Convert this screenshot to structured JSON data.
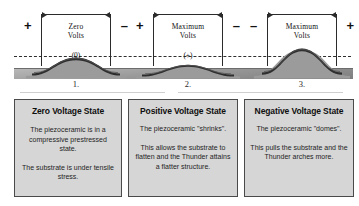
{
  "figure": {
    "reference_line": "neutral-axis-dashed-line",
    "ground": "substrate-base-plane"
  },
  "states": [
    {
      "number": "1.",
      "left_polarity": "+",
      "right_polarity": "–",
      "volt_label_line1": "Zero",
      "volt_label_line2": "Volts",
      "volt_sign": "(0)",
      "arch_profile": "moderate-arch",
      "box": {
        "title": "Zero Voltage State",
        "paragraph1": "The piezoceramic is in a compressive prestressed state.",
        "paragraph2": "The substrate is under tensile stress."
      }
    },
    {
      "number": "2.",
      "left_polarity": "+",
      "right_polarity": "–",
      "volt_label_line1": "Maximum",
      "volt_label_line2": "Volts",
      "volt_sign": "(+)",
      "arch_profile": "flattened-arch",
      "box": {
        "title": "Positive Voltage State",
        "paragraph1": "The piezoceramic \"shrinks\".",
        "paragraph2": "This allows the substrate to flatten and the Thunder attains a flatter structure."
      }
    },
    {
      "number": "3.",
      "left_polarity": "–",
      "right_polarity": "+",
      "volt_label_line1": "Maximum",
      "volt_label_line2": "Volts",
      "volt_sign": "(-)",
      "arch_profile": "raised-arch",
      "box": {
        "title": "Negative Voltage State",
        "paragraph1": "The piezoceramic \"domes\".",
        "paragraph2": "This pulls the substrate and the Thunder arches more."
      }
    }
  ],
  "colors": {
    "piezoceramic": "#2b2b2b",
    "substrate": "#8f8f8f",
    "ground": "#9a9a9a",
    "box_fill": "#d6d6d6",
    "box_border": "#4a4a4a",
    "line": "#2f2f2f"
  }
}
